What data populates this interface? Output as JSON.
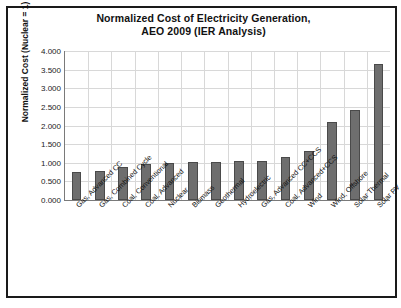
{
  "figure": {
    "title_line1": "Normalized Cost of Electricity Generation,",
    "title_line2": "AEO 2009 (IER Analysis)",
    "bar_color": "#6e6e6e",
    "bar_edge_color": "#4a4a4a",
    "grid_color": "#d8d8d8",
    "axis_color": "#7a7a7a",
    "background": "#ffffff"
  },
  "chart_data": {
    "type": "bar",
    "title": "Normalized Cost of Electricity Generation, AEO 2009 (IER Analysis)",
    "xlabel": "",
    "ylabel": "Normalized Cost (Nuclear = 1)",
    "ylim": [
      0,
      4
    ],
    "ytick_labels": [
      "0.000",
      "0.500",
      "1.000",
      "1.500",
      "2.000",
      "2.500",
      "3.000",
      "3.500",
      "4.000"
    ],
    "ytick_values": [
      0,
      0.5,
      1,
      1.5,
      2,
      2.5,
      3,
      3.5,
      4
    ],
    "grid": true,
    "legend": false,
    "categories": [
      "Gas, Advanced CC",
      "Gas, Combined Cycle",
      "Coal, Conventional",
      "Coal, Advanced",
      "Nuclear",
      "Biomass",
      "Geothermal",
      "Hydroelectric",
      "Gas, Advanced CC+CCS",
      "Coal, Advanced+CCS",
      "Wind",
      "Wind, Offshore",
      "Solar Thermal",
      "Solar PV"
    ],
    "values": [
      0.74,
      0.79,
      0.89,
      0.96,
      1.0,
      1.02,
      1.03,
      1.05,
      1.06,
      1.16,
      1.32,
      2.1,
      2.41,
      3.65
    ]
  }
}
